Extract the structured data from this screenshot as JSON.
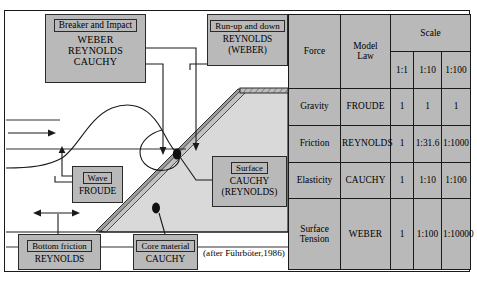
{
  "figure": {
    "credit": "(after Führböter,1986)"
  },
  "callouts": [
    {
      "id": "breaker",
      "header": "Breaker and Impact",
      "lines": [
        "WEBER",
        "REYNOLDS",
        "CAUCHY"
      ]
    },
    {
      "id": "runup",
      "header": "Run-up and down",
      "lines": [
        "REYNOLDS",
        "(WEBER)"
      ]
    },
    {
      "id": "wave",
      "header": "Wave",
      "lines": [
        "FROUDE"
      ]
    },
    {
      "id": "surface",
      "header": "Surface",
      "lines": [
        "CAUCHY",
        "(REYNOLDS)"
      ]
    },
    {
      "id": "bottom",
      "header": "Bottom friction",
      "lines": [
        "REYNOLDS"
      ]
    },
    {
      "id": "core",
      "header": "Core material",
      "lines": [
        "CAUCHY"
      ]
    }
  ],
  "table": {
    "headers": {
      "force": "Force",
      "model_law": "Model\nLaw",
      "scale": "Scale"
    },
    "header_force": "Force",
    "header_model_law_line1": "Model",
    "header_model_law_line2": "Law",
    "header_scale": "Scale",
    "scale_columns": [
      "1:1",
      "1:10",
      "1:100"
    ],
    "rows": [
      {
        "force": "Gravity",
        "force_line1": "Gravity",
        "force_line2": "",
        "law": "FROUDE",
        "values": [
          "1",
          "1",
          "1"
        ]
      },
      {
        "force": "Friction",
        "force_line1": "Friction",
        "force_line2": "",
        "law": "REYNOLDS",
        "values": [
          "1",
          "1:31.6",
          "1:1000"
        ]
      },
      {
        "force": "Elasticity",
        "force_line1": "Elasticity",
        "force_line2": "",
        "law": "CAUCHY",
        "values": [
          "1",
          "1:10",
          "1:100"
        ]
      },
      {
        "force": "Surface Tension",
        "force_line1": "Surface",
        "force_line2": "Tension",
        "law": "WEBER",
        "values": [
          "1",
          "1:100",
          "1:10000"
        ]
      }
    ]
  },
  "colors": {
    "box_fill": "#b9b9b9",
    "structure_fill": "#d6d6d6",
    "armour_fill": "#9a9a9a",
    "line": "#1a1a1a"
  }
}
